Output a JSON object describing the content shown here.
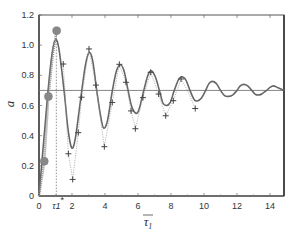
{
  "chart_data": {
    "type": "line",
    "title": "",
    "xlabel": "τ̄1",
    "ylabel": "a",
    "xlim": [
      0,
      14.85
    ],
    "ylim": [
      0,
      1.2
    ],
    "grid": false,
    "xticks": [
      0,
      2,
      4,
      6,
      8,
      10,
      12,
      14
    ],
    "xtick_labels": [
      "0",
      "",
      "4",
      "6",
      "8",
      "10",
      "12",
      "14"
    ],
    "xtick_label_2": "2",
    "yticks": [
      0,
      0.2,
      0.4,
      0.6,
      0.8,
      1.0,
      1.2
    ],
    "ytick_labels": [
      "0",
      "0.2",
      "0.4",
      "0.6",
      "0.8",
      "1.0",
      "1.2"
    ],
    "annotation": {
      "label": "τ1",
      "sup": "*",
      "x": 1.05
    },
    "reference_line": {
      "y": 0.7
    },
    "series": [
      {
        "name": "solid",
        "style": "solid",
        "x": [
          0,
          0.3,
          0.55,
          0.8,
          1.0,
          1.2,
          1.5,
          1.75,
          1.98,
          2.2,
          2.5,
          2.8,
          3.03,
          3.25,
          3.5,
          3.75,
          3.92,
          4.15,
          4.45,
          4.7,
          4.93,
          5.15,
          5.4,
          5.6,
          5.85,
          6.05,
          6.35,
          6.6,
          6.8,
          7.05,
          7.3,
          7.5,
          7.72,
          7.95,
          8.2,
          8.45,
          8.65,
          8.9,
          9.15,
          9.4,
          9.6,
          9.85,
          10.1,
          10.3,
          10.5,
          10.75,
          11.0,
          11.25,
          11.5,
          11.75,
          12.0,
          12.2,
          12.4,
          12.65,
          12.9,
          13.1,
          13.35,
          13.55,
          13.8,
          14.0,
          14.2,
          14.45,
          14.85
        ],
        "y": [
          0,
          0.38,
          0.7,
          0.95,
          1.035,
          0.98,
          0.72,
          0.45,
          0.32,
          0.38,
          0.62,
          0.86,
          0.95,
          0.9,
          0.7,
          0.52,
          0.45,
          0.5,
          0.7,
          0.83,
          0.87,
          0.83,
          0.7,
          0.6,
          0.55,
          0.57,
          0.7,
          0.8,
          0.83,
          0.79,
          0.7,
          0.62,
          0.6,
          0.62,
          0.7,
          0.77,
          0.79,
          0.77,
          0.7,
          0.64,
          0.63,
          0.65,
          0.7,
          0.745,
          0.76,
          0.745,
          0.7,
          0.665,
          0.66,
          0.67,
          0.7,
          0.73,
          0.74,
          0.73,
          0.7,
          0.675,
          0.67,
          0.68,
          0.7,
          0.72,
          0.73,
          0.72,
          0.7
        ]
      },
      {
        "name": "dashed",
        "style": "dotted",
        "x": [
          1.47,
          1.78,
          2.04,
          2.38,
          2.58,
          3.03,
          3.45,
          3.96,
          4.44,
          4.87,
          5.27,
          5.58,
          5.84,
          6.3,
          6.77,
          7.25,
          7.68,
          8.14,
          8.61,
          9.0,
          9.47
        ],
        "y": [
          0.875,
          0.28,
          0.11,
          0.42,
          0.655,
          0.975,
          0.735,
          0.327,
          0.62,
          0.873,
          0.754,
          0.564,
          0.446,
          0.652,
          0.82,
          0.676,
          0.532,
          0.632,
          0.776,
          0.7,
          0.58
        ]
      },
      {
        "name": "crosses",
        "style": "marker-plus",
        "x": [
          1.47,
          1.78,
          2.04,
          2.38,
          2.58,
          3.03,
          3.45,
          3.96,
          4.44,
          4.87,
          5.27,
          5.58,
          5.84,
          6.3,
          6.77,
          7.25,
          7.68,
          8.14,
          8.61,
          9.47
        ],
        "y": [
          0.875,
          0.28,
          0.11,
          0.42,
          0.655,
          0.975,
          0.735,
          0.327,
          0.62,
          0.873,
          0.754,
          0.564,
          0.446,
          0.652,
          0.82,
          0.676,
          0.532,
          0.632,
          0.776,
          0.58
        ]
      },
      {
        "name": "initial-rise",
        "style": "thick-dotted",
        "x": [
          0,
          0.32,
          0.57,
          0.85,
          1.07
        ],
        "y": [
          0,
          0.23,
          0.66,
          0.95,
          1.096
        ]
      },
      {
        "name": "dots",
        "style": "marker-circle",
        "x": [
          0.32,
          0.57,
          1.07
        ],
        "y": [
          0.23,
          0.66,
          1.096
        ]
      }
    ]
  }
}
